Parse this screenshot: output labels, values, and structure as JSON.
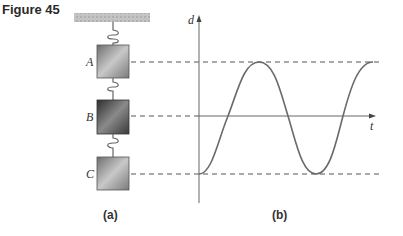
{
  "figure": {
    "label": "Figure 45"
  },
  "panel_a": {
    "caption": "(a)",
    "blocks": [
      {
        "label": "A",
        "y": 62
      },
      {
        "label": "B",
        "y": 116
      },
      {
        "label": "C",
        "y": 174
      }
    ]
  },
  "panel_b": {
    "caption": "(b)",
    "y_axis_label": "d",
    "x_axis_label": "t"
  },
  "colors": {
    "line": "#777777",
    "curve": "#6a6a6a",
    "ceiling": "#bdbdbd"
  }
}
